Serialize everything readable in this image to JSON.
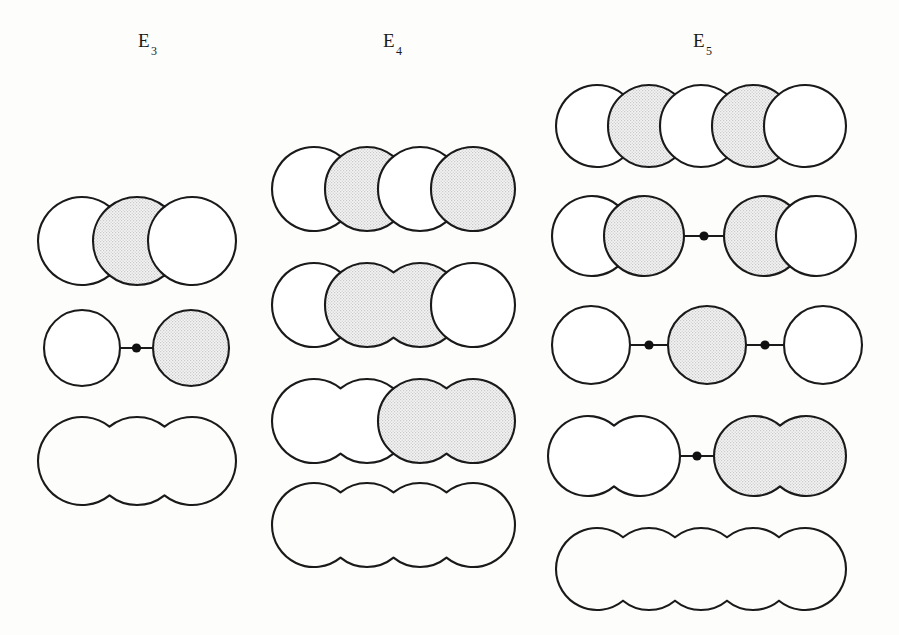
{
  "figure": {
    "background_color": "#fdfdfc",
    "stroke_color": "#1a1a1a",
    "shade_color": "#e9e9e9",
    "white_color": "#ffffff",
    "dot_color": "#111111"
  },
  "columns": [
    {
      "id": "E3",
      "label_letter": "E",
      "label_sub": "3",
      "label_x": 138,
      "label_y": 30,
      "chain_length": 3,
      "rows": [
        {
          "name": "e3-row-1",
          "x": 38,
          "y": 197,
          "radius": 44,
          "step": 55,
          "count": 3,
          "groups": [
            {
              "size": 1,
              "fill": "white"
            },
            {
              "size": 1,
              "fill": "shade"
            },
            {
              "size": 1,
              "fill": "white"
            }
          ],
          "bonds": [],
          "dividers": true,
          "outline_only": false
        },
        {
          "name": "e3-row-2",
          "x": 44,
          "y": 310,
          "radius": 38,
          "step": 55,
          "count": 2,
          "groups": [
            {
              "size": 1,
              "fill": "white"
            },
            {
              "size": 1,
              "fill": "shade"
            }
          ],
          "bonds": [
            {
              "after_group": 0,
              "gap": 33
            }
          ],
          "dividers": true,
          "outline_only": false
        },
        {
          "name": "e3-row-3",
          "x": 38,
          "y": 417,
          "radius": 44,
          "step": 55,
          "count": 3,
          "groups": [
            {
              "size": 3,
              "fill": "white"
            }
          ],
          "bonds": [],
          "dividers": false,
          "outline_only": true
        }
      ]
    },
    {
      "id": "E4",
      "label_letter": "E",
      "label_sub": "4",
      "label_x": 383,
      "label_y": 30,
      "chain_length": 4,
      "rows": [
        {
          "name": "e4-row-1",
          "x": 272,
          "y": 147,
          "radius": 42,
          "step": 53,
          "count": 4,
          "groups": [
            {
              "size": 1,
              "fill": "white"
            },
            {
              "size": 1,
              "fill": "shade"
            },
            {
              "size": 1,
              "fill": "white"
            },
            {
              "size": 1,
              "fill": "shade"
            }
          ],
          "bonds": [],
          "dividers": true,
          "outline_only": false
        },
        {
          "name": "e4-row-2",
          "x": 272,
          "y": 263,
          "radius": 42,
          "step": 53,
          "count": 4,
          "groups": [
            {
              "size": 1,
              "fill": "white"
            },
            {
              "size": 2,
              "fill": "shade"
            },
            {
              "size": 1,
              "fill": "white"
            }
          ],
          "bonds": [],
          "dividers": true,
          "outline_only": false
        },
        {
          "name": "e4-row-3",
          "x": 272,
          "y": 379,
          "radius": 42,
          "step": 53,
          "count": 4,
          "groups": [
            {
              "size": 2,
              "fill": "white"
            },
            {
              "size": 2,
              "fill": "shade"
            }
          ],
          "bonds": [],
          "dividers": true,
          "outline_only": false
        },
        {
          "name": "e4-row-4",
          "x": 272,
          "y": 483,
          "radius": 42,
          "step": 53,
          "count": 4,
          "groups": [
            {
              "size": 4,
              "fill": "white"
            }
          ],
          "bonds": [],
          "dividers": false,
          "outline_only": true
        }
      ]
    },
    {
      "id": "E5",
      "label_letter": "E",
      "label_sub": "5",
      "label_x": 693,
      "label_y": 30,
      "chain_length": 5,
      "rows": [
        {
          "name": "e5-row-1",
          "x": 556,
          "y": 85,
          "radius": 41,
          "step": 52,
          "count": 5,
          "groups": [
            {
              "size": 1,
              "fill": "white"
            },
            {
              "size": 1,
              "fill": "shade"
            },
            {
              "size": 1,
              "fill": "white"
            },
            {
              "size": 1,
              "fill": "shade"
            },
            {
              "size": 1,
              "fill": "white"
            }
          ],
          "bonds": [],
          "dividers": true,
          "outline_only": false
        },
        {
          "name": "e5-row-2",
          "x": 552,
          "y": 196,
          "radius": 40,
          "step": 52,
          "count": 4,
          "groups": [
            {
              "size": 1,
              "fill": "white"
            },
            {
              "size": 1,
              "fill": "shade"
            },
            {
              "size": 1,
              "fill": "shade"
            },
            {
              "size": 1,
              "fill": "white"
            }
          ],
          "bonds": [
            {
              "after_group": 1,
              "gap": 40
            }
          ],
          "dividers": true,
          "outline_only": false
        },
        {
          "name": "e5-row-3",
          "x": 552,
          "y": 306,
          "radius": 39,
          "step": 52,
          "count": 3,
          "groups": [
            {
              "size": 1,
              "fill": "white"
            },
            {
              "size": 1,
              "fill": "shade"
            },
            {
              "size": 1,
              "fill": "white"
            }
          ],
          "bonds": [
            {
              "after_group": 0,
              "gap": 38
            },
            {
              "after_group": 1,
              "gap": 38
            }
          ],
          "dividers": true,
          "outline_only": false
        },
        {
          "name": "e5-row-4",
          "x": 548,
          "y": 416,
          "radius": 40,
          "step": 52,
          "count": 4,
          "groups": [
            {
              "size": 2,
              "fill": "white"
            },
            {
              "size": 2,
              "fill": "shade"
            }
          ],
          "bonds": [
            {
              "after_group": 0,
              "gap": 34
            }
          ],
          "dividers": false,
          "outline_only": false
        },
        {
          "name": "e5-row-5",
          "x": 556,
          "y": 528,
          "radius": 41,
          "step": 52,
          "count": 5,
          "groups": [
            {
              "size": 5,
              "fill": "white"
            }
          ],
          "bonds": [],
          "dividers": false,
          "outline_only": true
        }
      ]
    }
  ]
}
